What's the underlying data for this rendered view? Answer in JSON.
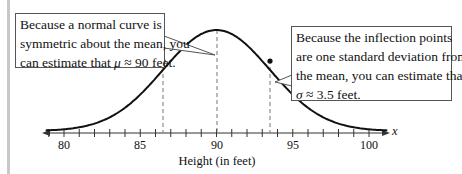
{
  "chart_data": {
    "type": "line",
    "title": "",
    "xlabel": "Height (in feet)",
    "x_variable": "x",
    "ylabel": "",
    "xlim": [
      78.5,
      101
    ],
    "x_ticks_major": [
      80,
      85,
      90,
      95,
      100
    ],
    "x_ticks_minor_step": 1,
    "tick_labels": [
      "80",
      "85",
      "90",
      "95",
      "100"
    ],
    "grid": false,
    "series": [
      {
        "name": "normal curve",
        "distribution": "normal",
        "mean": 90,
        "std": 3.5
      }
    ],
    "inflection_points": [
      86.5,
      93.5
    ],
    "reference_lines": [
      {
        "x": 86.5,
        "style": "dashed"
      },
      {
        "x": 90,
        "style": "dashed"
      },
      {
        "x": 93.5,
        "style": "dashed"
      }
    ],
    "annotations": [
      {
        "text_lines": [
          "Because a normal curve is",
          "symmetric about the mean, you",
          "can estimate that μ ≈ 90 feet."
        ],
        "points_to": 90
      },
      {
        "text_lines": [
          "Because the inflection points",
          "are one standard deviation from",
          "the mean, you can estimate that",
          "σ ≈ 3.5 feet."
        ],
        "points_to": 93.5
      }
    ]
  },
  "callouts": {
    "left": {
      "line1": "Because a normal curve is",
      "line2": "symmetric about the mean, you",
      "line3_prefix": "can estimate that ",
      "symbol": "μ",
      "line3_suffix": " ≈ 90 feet."
    },
    "right": {
      "line1": "Because the inflection points",
      "line2": "are one standard deviation from",
      "line3": "the mean, you can estimate that",
      "symbol": "σ",
      "line4_suffix": " ≈ 3.5 feet."
    }
  },
  "axis": {
    "ticks": [
      "80",
      "85",
      "90",
      "95",
      "100"
    ],
    "title": "Height (in feet)",
    "variable": "x"
  }
}
